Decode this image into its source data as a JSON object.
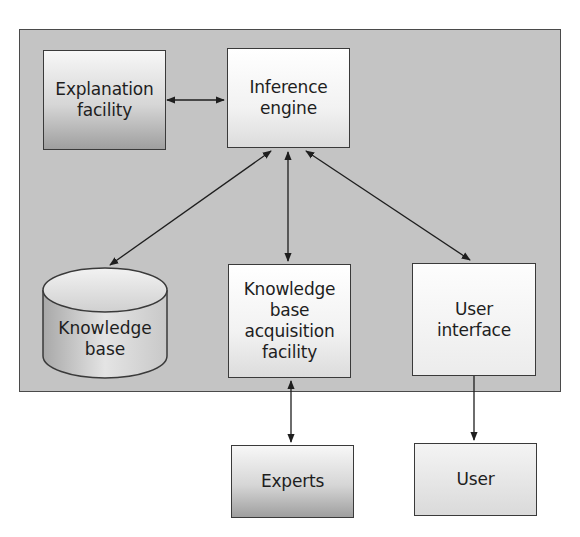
{
  "diagram": {
    "container": {
      "label": "Expert system"
    },
    "nodes": {
      "explanation_facility": {
        "label": "Explanation\nfacility",
        "shape": "rectangle",
        "shading": "gradient-dark"
      },
      "inference_engine": {
        "label": "Inference\nengine",
        "shape": "rectangle",
        "shading": "gradient-light"
      },
      "knowledge_base": {
        "label": "Knowledge\nbase",
        "shape": "cylinder",
        "shading": "gradient"
      },
      "kb_acquisition_facility": {
        "label": "Knowledge\nbase\nacquisition\nfacility",
        "shape": "rectangle",
        "shading": "gradient-light"
      },
      "user_interface": {
        "label": "User\ninterface",
        "shape": "rectangle",
        "shading": "light"
      },
      "experts": {
        "label": "Experts",
        "shape": "rectangle",
        "shading": "gradient-dark"
      },
      "user": {
        "label": "User",
        "shape": "rectangle",
        "shading": "light"
      }
    },
    "edges": [
      {
        "from": "explanation_facility",
        "to": "inference_engine",
        "direction": "both"
      },
      {
        "from": "inference_engine",
        "to": "knowledge_base",
        "direction": "both"
      },
      {
        "from": "inference_engine",
        "to": "kb_acquisition_facility",
        "direction": "both"
      },
      {
        "from": "inference_engine",
        "to": "user_interface",
        "direction": "both"
      },
      {
        "from": "kb_acquisition_facility",
        "to": "experts",
        "direction": "both"
      },
      {
        "from": "user_interface",
        "to": "user",
        "direction": "forward"
      }
    ],
    "colors": {
      "panel": "#c4c4c4",
      "border": "#3a3a3a",
      "text": "#1e1e1e"
    }
  }
}
